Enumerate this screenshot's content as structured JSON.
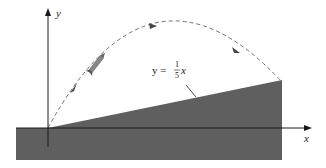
{
  "figure": {
    "axes": {
      "x_label": "x",
      "y_label": "y"
    },
    "line_label": {
      "lhs": "y = ",
      "numerator": "1",
      "denominator": "5",
      "var": "x"
    },
    "colors": {
      "ground": "#5f5f5f",
      "axis": "#1a1a1a",
      "trajectory": "#666666",
      "background": "#ffffff"
    },
    "elements": [
      "ground-region",
      "inclined-plane",
      "projectile-trajectory",
      "rocket",
      "x-axis",
      "y-axis"
    ]
  }
}
